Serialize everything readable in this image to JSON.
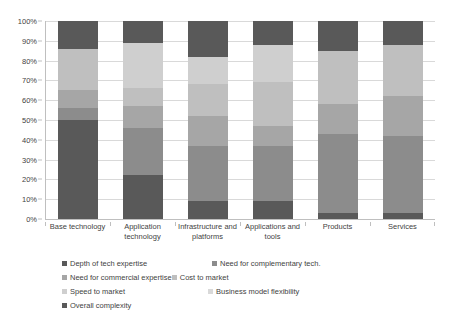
{
  "chart_data": {
    "type": "bar",
    "subtype": "stacked-100-percent",
    "title": "",
    "xlabel": "",
    "ylabel": "",
    "ylim": [
      0,
      100
    ],
    "ytick_labels": [
      "0%",
      "10%",
      "20%",
      "30%",
      "40%",
      "50%",
      "60%",
      "70%",
      "80%",
      "90%",
      "100%"
    ],
    "ytick_values": [
      0,
      10,
      20,
      30,
      40,
      50,
      60,
      70,
      80,
      90,
      100
    ],
    "grid": true,
    "legend_position": "bottom-left",
    "categories": [
      "Base technology",
      "Application technology",
      "Infrastructure and platforms",
      "Applications and tools",
      "Products",
      "Services"
    ],
    "series": [
      {
        "name": "Depth of tech expertise",
        "color": "#595959",
        "values": [
          50,
          22,
          9,
          9,
          3,
          3
        ]
      },
      {
        "name": "Need for complementary tech.",
        "color": "#8c8c8c",
        "values": [
          6,
          24,
          28,
          28,
          40,
          39
        ]
      },
      {
        "name": "Need for commercial expertise",
        "color": "#a6a6a6",
        "values": [
          9,
          11,
          15,
          10,
          15,
          20
        ]
      },
      {
        "name": "Cost to market",
        "color": "#bfbfbf",
        "values": [
          21,
          9,
          16,
          22,
          27,
          26
        ]
      },
      {
        "name": "Speed to market",
        "color": "#cfcfcf",
        "values": [
          0,
          23,
          14,
          19,
          0,
          0
        ]
      },
      {
        "name": "Business model flexibility",
        "color": "#d9d9d9",
        "values": [
          0,
          0,
          0,
          0,
          0,
          0
        ]
      },
      {
        "name": "Overall complexity",
        "color": "#595959",
        "values": [
          14,
          11,
          18,
          12,
          15,
          12
        ]
      }
    ]
  },
  "legend": {
    "items": [
      {
        "label": "Depth of tech expertise",
        "color": "#595959"
      },
      {
        "label": "Need for complementary tech.",
        "color": "#8c8c8c"
      },
      {
        "label": "Need for commercial expertise",
        "color": "#a6a6a6"
      },
      {
        "label": "Cost to market",
        "color": "#bfbfbf"
      },
      {
        "label": "Speed to market",
        "color": "#cfcfcf"
      },
      {
        "label": "Business model flexibility",
        "color": "#d9d9d9"
      },
      {
        "label": "Overall complexity",
        "color": "#595959"
      }
    ]
  },
  "colors": {
    "gridline": "#d9d9d9",
    "axis": "#bfbfbf",
    "text": "#3f3f3f",
    "background": "#ffffff"
  }
}
